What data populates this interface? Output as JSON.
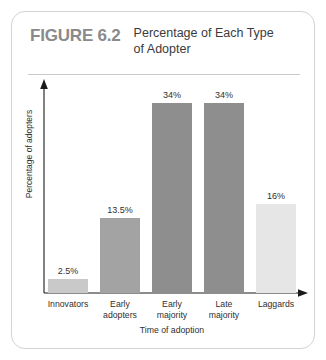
{
  "figure": {
    "number_label": "FIGURE 6.2",
    "title": "Percentage of Each Type of Adopter"
  },
  "chart_data": {
    "type": "bar",
    "title": "Percentage of Each Type of Adopter",
    "xlabel": "Time of adoption",
    "ylabel": "Percentage of adopters",
    "categories": [
      "Innovators",
      "Early adopters",
      "Early majority",
      "Late majority",
      "Laggards"
    ],
    "category_lines": [
      [
        "Innovators"
      ],
      [
        "Early",
        "adopters"
      ],
      [
        "Early",
        "majority"
      ],
      [
        "Late",
        "majority"
      ],
      [
        "Laggards"
      ]
    ],
    "values": [
      2.5,
      13.5,
      34,
      34,
      16
    ],
    "value_labels": [
      "2.5%",
      "13.5%",
      "34%",
      "34%",
      "16%"
    ],
    "bar_colors": [
      "#c9c9c9",
      "#a3a3a3",
      "#8e8e8e",
      "#8e8e8e",
      "#e6e6e6"
    ],
    "ylim": [
      0,
      38
    ],
    "grid": false,
    "legend": "none",
    "axis_arrows": true
  },
  "colors": {
    "card_border": "#d3d3d3",
    "figure_number": "#8a8a8a",
    "title_text": "#3b3b3b",
    "rule": "#c9c9c9",
    "axis": "#1a1a1a",
    "label_text": "#2f2f2f"
  }
}
